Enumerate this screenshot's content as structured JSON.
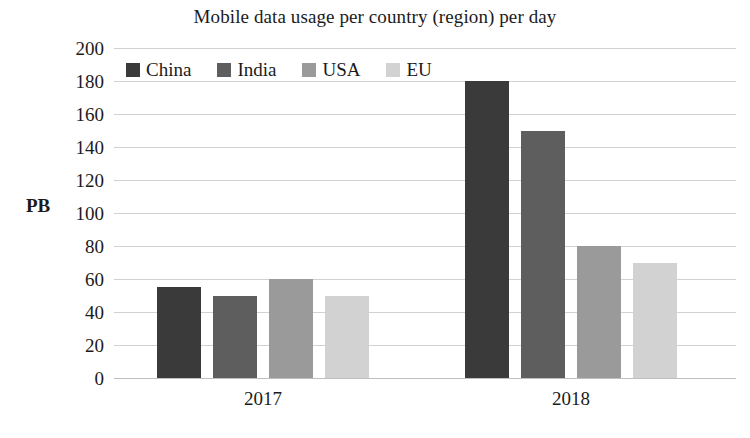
{
  "chart_data": {
    "type": "bar",
    "title": "Mobile data usage per country (region) per day",
    "xlabel": "",
    "ylabel": "PB",
    "categories": [
      "2017",
      "2018"
    ],
    "series": [
      {
        "name": "China",
        "values": [
          55,
          180
        ],
        "color": "#3a3a3a"
      },
      {
        "name": "India",
        "values": [
          50,
          150
        ],
        "color": "#5e5e5e"
      },
      {
        "name": "USA",
        "values": [
          60,
          80
        ],
        "color": "#9a9a9a"
      },
      {
        "name": "EU",
        "values": [
          50,
          70
        ],
        "color": "#d2d2d2"
      }
    ],
    "ylim": [
      0,
      200
    ],
    "ytick_step": 20,
    "yticks": [
      200,
      180,
      160,
      140,
      120,
      100,
      80,
      60,
      40,
      20,
      0
    ],
    "grid": true,
    "grid_axis": "y",
    "legend_position": "top-left-inside",
    "units": "PB"
  },
  "legend": {
    "items": [
      {
        "label": "China",
        "color": "#3a3a3a"
      },
      {
        "label": "India",
        "color": "#5e5e5e"
      },
      {
        "label": "USA",
        "color": "#9a9a9a"
      },
      {
        "label": "EU",
        "color": "#d2d2d2"
      }
    ]
  },
  "axes": {
    "y_label": "PB",
    "y_ticks": [
      "200",
      "180",
      "160",
      "140",
      "120",
      "100",
      "80",
      "60",
      "40",
      "20",
      "0"
    ],
    "x_ticks": [
      "2017",
      "2018"
    ]
  }
}
